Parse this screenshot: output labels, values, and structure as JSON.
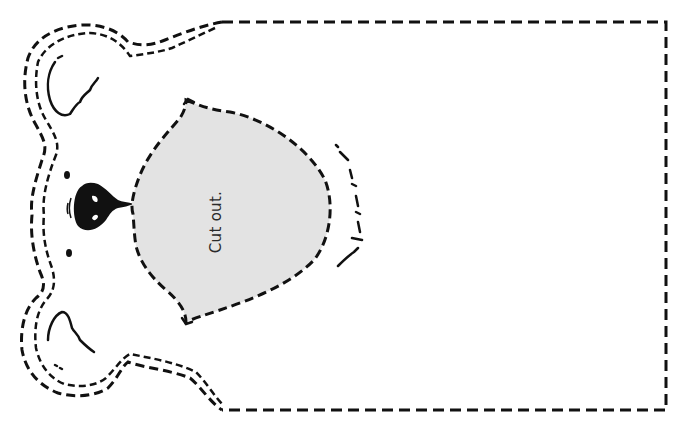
{
  "worksheet": {
    "title": "Bear head puppet cut-out template",
    "cut_label": "Cut out.",
    "colors": {
      "line": "#111111",
      "cutout_fill": "#e3e3e3",
      "background": "#ffffff"
    },
    "parts": [
      "head-outline-dashed",
      "top-ear",
      "bottom-ear",
      "eye-top",
      "eye-bottom",
      "nose",
      "mouth-cutout-region",
      "muzzle-fur-line",
      "puppet-body-rectangle-dashed"
    ]
  }
}
